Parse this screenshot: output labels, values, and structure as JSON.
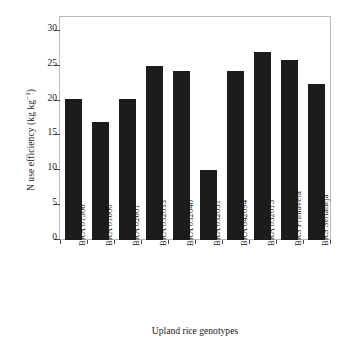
{
  "chart_data": {
    "type": "bar",
    "title": "",
    "xlabel": "Upland rice genotypes",
    "ylabel": "N use efficiency (kg kg",
    "ylabel_sup": "−1",
    "ylabel_tail": ")",
    "ylabel_full": "N use efficiency (kg kg⁻¹)",
    "categories": [
      "BRA 01506",
      "BRA 01600",
      "BRA 02601",
      "BRA 032033",
      "BRA 032048",
      "BRA 032051",
      "BRA 042094",
      "BRA 052015",
      "BRS Primavera",
      "BRS Sertaneja"
    ],
    "values": [
      20.2,
      17.0,
      20.3,
      25.0,
      24.2,
      10.1,
      24.3,
      27.0,
      25.8,
      22.4
    ],
    "ylim": [
      0,
      32
    ],
    "yticks": [
      0,
      5,
      10,
      15,
      20,
      25,
      30
    ],
    "ytick_labels": [
      "0",
      "5",
      "10",
      "15",
      "20",
      "25",
      "30"
    ],
    "grid": false,
    "legend": false,
    "bar_color": "#1c1c1c",
    "frame_color": "#b9b9b9",
    "background": "#ffffff"
  }
}
